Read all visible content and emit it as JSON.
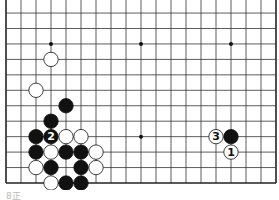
{
  "board": {
    "size": 19,
    "visible_rows_from_bottom": 12,
    "origin_x": 6,
    "bottom_y": 183,
    "spacing_x": 15,
    "spacing_y": 15.45,
    "star_points": [
      [
        4,
        4
      ],
      [
        10,
        4
      ],
      [
        16,
        4
      ],
      [
        4,
        10
      ],
      [
        10,
        10
      ],
      [
        16,
        10
      ]
    ],
    "stones": [
      {
        "col": 4,
        "row": 9,
        "color": "white",
        "label": ""
      },
      {
        "col": 3,
        "row": 7,
        "color": "white",
        "label": ""
      },
      {
        "col": 5,
        "row": 6,
        "color": "black",
        "label": ""
      },
      {
        "col": 4,
        "row": 5,
        "color": "black",
        "label": ""
      },
      {
        "col": 3,
        "row": 4,
        "color": "black",
        "label": ""
      },
      {
        "col": 4,
        "row": 4,
        "color": "black",
        "label": "2"
      },
      {
        "col": 5,
        "row": 4,
        "color": "white",
        "label": ""
      },
      {
        "col": 6,
        "row": 4,
        "color": "white",
        "label": ""
      },
      {
        "col": 3,
        "row": 3,
        "color": "black",
        "label": ""
      },
      {
        "col": 4,
        "row": 3,
        "color": "white",
        "label": ""
      },
      {
        "col": 5,
        "row": 3,
        "color": "black",
        "label": ""
      },
      {
        "col": 6,
        "row": 3,
        "color": "black",
        "label": ""
      },
      {
        "col": 7,
        "row": 3,
        "color": "white",
        "label": ""
      },
      {
        "col": 3,
        "row": 2,
        "color": "white",
        "label": ""
      },
      {
        "col": 4,
        "row": 2,
        "color": "black",
        "label": ""
      },
      {
        "col": 6,
        "row": 2,
        "color": "black",
        "label": ""
      },
      {
        "col": 7,
        "row": 2,
        "color": "white",
        "label": ""
      },
      {
        "col": 4,
        "row": 1,
        "color": "white",
        "label": ""
      },
      {
        "col": 5,
        "row": 1,
        "color": "black",
        "label": ""
      },
      {
        "col": 6,
        "row": 1,
        "color": "black",
        "label": ""
      },
      {
        "col": 16,
        "row": 4,
        "color": "black",
        "label": ""
      },
      {
        "col": 15,
        "row": 4,
        "color": "white",
        "label": "3"
      },
      {
        "col": 16,
        "row": 3,
        "color": "white",
        "label": "1"
      }
    ],
    "colors": {
      "line": "#333333",
      "black_stone": "#111111",
      "white_stone": "#ffffff",
      "edge": "#222222"
    }
  },
  "caption": "8正"
}
